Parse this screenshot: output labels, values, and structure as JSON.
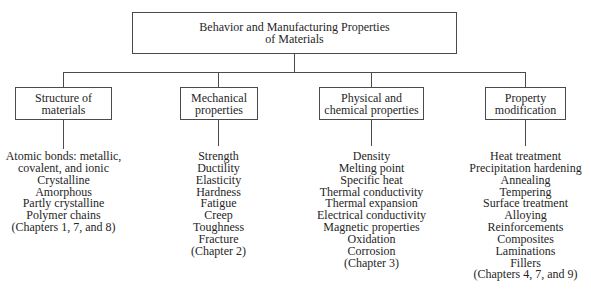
{
  "root": {
    "title_line1": "Behavior and Manufacturing Properties",
    "title_line2": "of Materials"
  },
  "categories": [
    {
      "id": "structure",
      "label_line1": "Structure of",
      "label_line2": "materials",
      "items": [
        "Atomic bonds: metallic,",
        "covalent, and ionic",
        "Crystalline",
        "Amorphous",
        "Partly crystalline",
        "Polymer chains",
        "(Chapters 1, 7, and 8)"
      ]
    },
    {
      "id": "mechanical",
      "label_line1": "Mechanical",
      "label_line2": "properties",
      "items": [
        "Strength",
        "Ductility",
        "Elasticity",
        "Hardness",
        "Fatigue",
        "Creep",
        "Toughness",
        "Fracture",
        "(Chapter 2)"
      ]
    },
    {
      "id": "physical",
      "label_line1": "Physical and",
      "label_line2": "chemical properties",
      "items": [
        "Density",
        "Melting point",
        "Specific heat",
        "Thermal conductivity",
        "Thermal expansion",
        "Electrical conductivity",
        "Magnetic properties",
        "Oxidation",
        "Corrosion",
        "(Chapter 3)"
      ]
    },
    {
      "id": "modification",
      "label_line1": "Property",
      "label_line2": "modification",
      "items": [
        "Heat treatment",
        "Precipitation hardening",
        "Annealing",
        "Tempering",
        "Surface treatment",
        "Alloying",
        "Reinforcements",
        "Composites",
        "Laminations",
        "Fillers",
        "(Chapters 4, 7, and 9)"
      ]
    }
  ],
  "colors": {
    "line": "#4a4a4a",
    "text": "#262626",
    "background": "#ffffff"
  }
}
